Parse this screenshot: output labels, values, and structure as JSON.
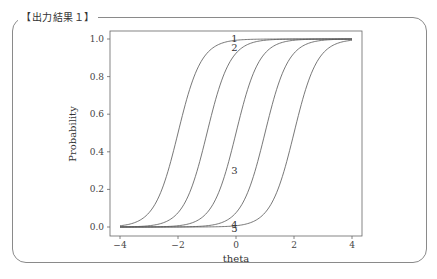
{
  "panel": {
    "title": "【出力結果１】"
  },
  "chart_data": {
    "type": "line",
    "title": "",
    "xlabel": "theta",
    "ylabel": "Probability",
    "xlim": [
      -4.3,
      4.3
    ],
    "ylim": [
      -0.04,
      1.04
    ],
    "xticks": [
      -4,
      -2,
      0,
      2,
      4
    ],
    "xtick_labels": [
      "−4",
      "−2",
      "0",
      "2",
      "4"
    ],
    "yticks": [
      0.0,
      0.2,
      0.4,
      0.6,
      0.8,
      1.0
    ],
    "ytick_labels": [
      "0.0",
      "0.2",
      "0.4",
      "0.6",
      "0.8",
      "1.0"
    ],
    "grid": false,
    "legend": null,
    "x": [
      -4,
      -3.5,
      -3,
      -2.5,
      -2,
      -1.5,
      -1,
      -0.5,
      0,
      0.5,
      1,
      1.5,
      2,
      2.5,
      3,
      3.5,
      4
    ],
    "series": [
      {
        "name": "1",
        "difficulty": -2,
        "discrimination": 2.5,
        "values": [
          0.007,
          0.023,
          0.076,
          0.223,
          0.5,
          0.777,
          0.924,
          0.977,
          0.993,
          0.998,
          0.999,
          1.0,
          1.0,
          1.0,
          1.0,
          1.0,
          1.0
        ]
      },
      {
        "name": "2",
        "difficulty": -1,
        "discrimination": 2.5,
        "values": [
          0.001,
          0.002,
          0.007,
          0.023,
          0.076,
          0.223,
          0.5,
          0.777,
          0.924,
          0.977,
          0.993,
          0.998,
          0.999,
          1.0,
          1.0,
          1.0,
          1.0
        ]
      },
      {
        "name": "3",
        "difficulty": 0,
        "discrimination": 2.5,
        "values": [
          0.0,
          0.0,
          0.001,
          0.002,
          0.007,
          0.023,
          0.076,
          0.223,
          0.5,
          0.777,
          0.924,
          0.977,
          0.993,
          0.998,
          0.999,
          1.0,
          1.0
        ]
      },
      {
        "name": "4",
        "difficulty": 1,
        "discrimination": 2.5,
        "values": [
          0.0,
          0.0,
          0.0,
          0.0,
          0.001,
          0.002,
          0.007,
          0.023,
          0.076,
          0.223,
          0.5,
          0.777,
          0.924,
          0.977,
          0.993,
          0.998,
          0.999
        ]
      },
      {
        "name": "5",
        "difficulty": 2,
        "discrimination": 2.5,
        "values": [
          0.0,
          0.0,
          0.0,
          0.0,
          0.0,
          0.0,
          0.001,
          0.002,
          0.007,
          0.023,
          0.076,
          0.223,
          0.5,
          0.777,
          0.924,
          0.977,
          0.993
        ]
      }
    ],
    "annotations": [
      {
        "text": "1",
        "x": -0.05,
        "y": 1.0
      },
      {
        "text": "2",
        "x": -0.05,
        "y": 0.95
      },
      {
        "text": "3",
        "x": -0.05,
        "y": 0.3
      },
      {
        "text": "4",
        "x": -0.05,
        "y": 0.01
      },
      {
        "text": "5",
        "x": -0.05,
        "y": -0.01
      }
    ]
  }
}
